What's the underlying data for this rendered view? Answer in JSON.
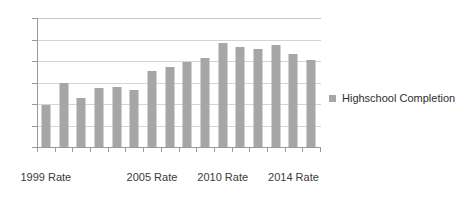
{
  "chart_data": {
    "type": "bar",
    "title": "",
    "subtitle": "",
    "xlabel": "",
    "ylabel": "",
    "ylim": [
      0,
      300
    ],
    "yticks": [
      0,
      50,
      100,
      150,
      200,
      250,
      300
    ],
    "grid": true,
    "legend_position": "right",
    "bar_color": "#a6a6a6",
    "categories": [
      "1999 Rate",
      "",
      "",
      "",
      "",
      "",
      "2005 Rate",
      "",
      "",
      "",
      "2010 Rate",
      "",
      "",
      "",
      "2014 Rate",
      ""
    ],
    "visible_tick_labels": [
      "1999 Rate",
      "2005 Rate",
      "2010 Rate",
      "2014 Rate"
    ],
    "series": [
      {
        "name": "Highschool Completion",
        "values": [
          98,
          148,
          115,
          138,
          140,
          132,
          176,
          185,
          198,
          208,
          243,
          232,
          228,
          237,
          216,
          203
        ]
      }
    ]
  },
  "axis": {
    "y_tick_labels": [
      "300",
      "250",
      "200",
      "150",
      "100",
      "50",
      "0"
    ],
    "x_tick_labels": [
      "1999 Rate",
      "2005 Rate",
      "2010 Rate",
      "2014 Rate"
    ]
  },
  "legend": {
    "entries": [
      {
        "label": "Highschool Completion",
        "color": "#a6a6a6",
        "marker": "square-marker"
      }
    ]
  }
}
